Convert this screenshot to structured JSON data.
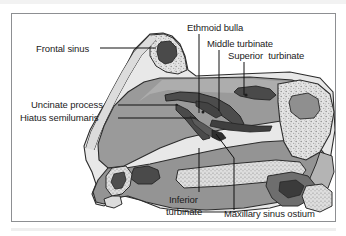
{
  "figure": {
    "type": "anatomical-illustration",
    "orientation": "left-facing sagittal view"
  },
  "labels": {
    "frontal_sinus": "Frontal sinus",
    "ethmoid_bulla": "Ethmoid bulla",
    "middle_turbinate": "Middle turbinate",
    "superior_turbinate": "Superior  turbinate",
    "uncinate_process": "Uncinate process",
    "hiatus_semilumaris": "Hiatus semilumaris",
    "inferior_turbinate_line1": "Inferior",
    "inferior_turbinate_line2": "turbinate",
    "maxillary_sinus_ostium": "Maxillary sinus ostium"
  },
  "colors": {
    "background": "#ffffff",
    "frame_border": "#8d8f92",
    "mucosa_mid_gray": "#9a9a9a",
    "mucosa_dark": "#6f6f6f",
    "bone_light_gray": "#c9c9c9",
    "bone_pale": "#e2e2e2",
    "turbinate_dark": "#4a4a4a",
    "cavity_black": "#3a3a3a",
    "leader_line": "#111111",
    "label_text": "#1b1b1b",
    "top_strip": "#f2f2f2"
  }
}
